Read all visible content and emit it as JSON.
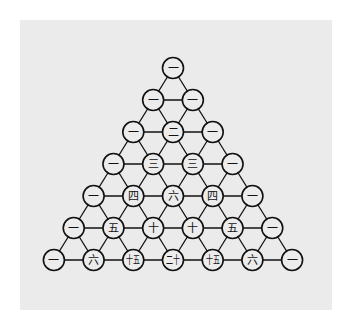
{
  "colors": {
    "background": "#ffffff",
    "panel": "#ebebeb",
    "ink": "#111111",
    "node_fill": "#ececec"
  },
  "rows": [
    [
      "一"
    ],
    [
      "一",
      "一"
    ],
    [
      "一",
      "二",
      "一"
    ],
    [
      "一",
      "三",
      "三",
      "一"
    ],
    [
      "一",
      "四",
      "六",
      "四",
      "一"
    ],
    [
      "一",
      "五",
      "十",
      "十",
      "五",
      "一"
    ],
    [
      "一",
      "六",
      "十五",
      "二十",
      "十五",
      "六",
      "一"
    ]
  ],
  "row_values": [
    [
      1
    ],
    [
      1,
      1
    ],
    [
      1,
      2,
      1
    ],
    [
      1,
      3,
      3,
      1
    ],
    [
      1,
      4,
      6,
      4,
      1
    ],
    [
      1,
      5,
      10,
      10,
      5,
      1
    ],
    [
      1,
      6,
      15,
      20,
      15,
      6,
      1
    ]
  ],
  "layout": {
    "apex_x": 173,
    "apex_y": 68,
    "row_gap": 32,
    "col_gap": 39.7,
    "node_radius": 10.5
  }
}
